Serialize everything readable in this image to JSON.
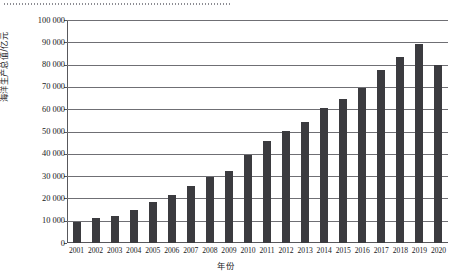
{
  "figure": {
    "top_rule_name": "dotted-rule-artifact"
  },
  "chart_data": {
    "type": "bar",
    "title": "",
    "xlabel": "年份",
    "ylabel": "海洋生产总值/亿元",
    "categories": [
      "2001",
      "2002",
      "2003",
      "2004",
      "2005",
      "2006",
      "2007",
      "2008",
      "2009",
      "2010",
      "2011",
      "2012",
      "2013",
      "2014",
      "2015",
      "2016",
      "2017",
      "2018",
      "2019",
      "2020"
    ],
    "values": [
      9518,
      11271,
      11952,
      14662,
      18418,
      21592,
      25619,
      29718,
      32162,
      39619,
      45580,
      50087,
      54313,
      60699,
      64669,
      69694,
      77611,
      83415,
      89415,
      79700
    ],
    "ylim": [
      0,
      100000
    ],
    "ytick_labels": [
      "0",
      "10 000",
      "20 000",
      "30 000",
      "40 000",
      "50 000",
      "60 000",
      "70 000",
      "80 000",
      "90 000",
      "100 000"
    ],
    "ytick_values": [
      0,
      10000,
      20000,
      30000,
      40000,
      50000,
      60000,
      70000,
      80000,
      90000,
      100000
    ],
    "grid": true,
    "legend": "none",
    "bar_color": "#3b3b3f",
    "grid_color": "#6f6f74",
    "axis_color": "#58585c",
    "background": "#ffffff"
  }
}
